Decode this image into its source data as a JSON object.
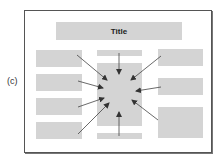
{
  "figure": {
    "panel_label": "(c)",
    "title": "Title",
    "colors": {
      "box_fill": "#d4d4d4",
      "frame_border": "#555555",
      "arrow": "#444444",
      "background": "#ffffff"
    },
    "boxes": {
      "title_bar": {
        "x": 56,
        "y": 22,
        "w": 126,
        "h": 18,
        "label": "Title"
      },
      "center_top_bar": {
        "x": 97,
        "y": 50,
        "w": 45,
        "h": 6
      },
      "center_box": {
        "x": 97,
        "y": 63,
        "w": 45,
        "h": 63
      },
      "center_bottom_bar": {
        "x": 97,
        "y": 133,
        "w": 45,
        "h": 6
      },
      "left": [
        {
          "x": 36,
          "y": 50,
          "w": 46,
          "h": 17
        },
        {
          "x": 36,
          "y": 74,
          "w": 46,
          "h": 17
        },
        {
          "x": 36,
          "y": 98,
          "w": 46,
          "h": 17
        },
        {
          "x": 36,
          "y": 122,
          "w": 46,
          "h": 17
        }
      ],
      "right": [
        {
          "x": 158,
          "y": 49,
          "w": 45,
          "h": 17
        },
        {
          "x": 158,
          "y": 78,
          "w": 45,
          "h": 17
        },
        {
          "x": 158,
          "y": 107,
          "w": 45,
          "h": 31
        }
      ]
    },
    "arrows": [
      {
        "from": [
          77,
          55
        ],
        "to": [
          107,
          80
        ]
      },
      {
        "from": [
          78,
          81
        ],
        "to": [
          103,
          88
        ]
      },
      {
        "from": [
          78,
          107
        ],
        "to": [
          104,
          98
        ]
      },
      {
        "from": [
          78,
          134
        ],
        "to": [
          109,
          103
        ]
      },
      {
        "from": [
          119,
          53
        ],
        "to": [
          119,
          74
        ]
      },
      {
        "from": [
          119,
          136
        ],
        "to": [
          119,
          112
        ]
      },
      {
        "from": [
          161,
          56
        ],
        "to": [
          131,
          80
        ]
      },
      {
        "from": [
          161,
          87
        ],
        "to": [
          136,
          91
        ]
      },
      {
        "from": [
          158,
          120
        ],
        "to": [
          132,
          100
        ]
      }
    ]
  }
}
